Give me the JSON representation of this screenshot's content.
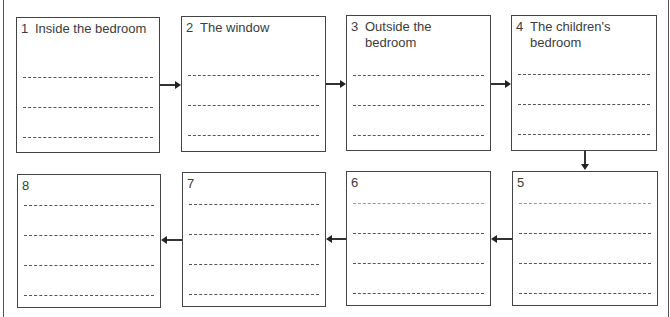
{
  "boxes": [
    {
      "number": "1",
      "label": "Inside the bedroom"
    },
    {
      "number": "2",
      "label": "The window"
    },
    {
      "number": "3",
      "label": "Outside the\nbedroom"
    },
    {
      "number": "4",
      "label": "The children's\nbedroom"
    },
    {
      "number": "5",
      "label": ""
    },
    {
      "number": "6",
      "label": ""
    },
    {
      "number": "7",
      "label": ""
    },
    {
      "number": "8",
      "label": ""
    }
  ],
  "flow_order": [
    "1",
    "2",
    "3",
    "4",
    "5",
    "6",
    "7",
    "8"
  ]
}
